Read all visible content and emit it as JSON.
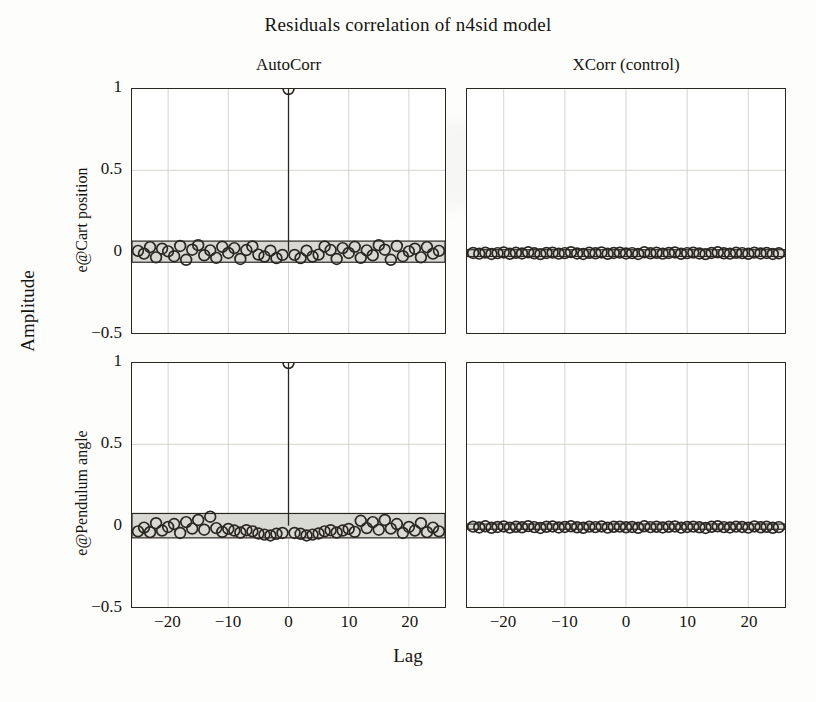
{
  "figure": {
    "title": "Residuals correlation of n4sid model",
    "xlabel": "Lag",
    "ylabel": "Amplitude"
  },
  "columns": [
    {
      "title": "AutoCorr"
    },
    {
      "title": "XCorr (control)"
    }
  ],
  "rows": [
    {
      "ylabel": "e@Cart position"
    },
    {
      "ylabel": "e@Pendulum angle"
    }
  ],
  "axes": {
    "ytick_labels": [
      "1",
      "0.5",
      "0",
      "−0.5"
    ],
    "ytick_values": [
      1,
      0.5,
      0,
      -0.5
    ],
    "xtick_labels": [
      "−20",
      "−10",
      "0",
      "10",
      "20"
    ],
    "xtick_values": [
      -20,
      -10,
      0,
      10,
      20
    ],
    "xlim": [
      -26,
      26
    ],
    "ylim": [
      -0.5,
      1.0
    ]
  },
  "style": {
    "line_color": "#2a2722",
    "band_fill": "#d9d9d4",
    "band_edge": "#2a2722",
    "grid_color": "#cfcfc9",
    "marker": "open-circle",
    "marker_radius_px": 5.4,
    "background": "#fdfdfc"
  },
  "chart_data": {
    "type": "line",
    "title": "Residuals correlation of n4sid model",
    "xlabel": "Lag",
    "ylabel": "Amplitude",
    "grid": true,
    "legend": "none",
    "xlim": [
      -26,
      26
    ],
    "ylim": [
      -0.5,
      1.0
    ],
    "panels": [
      {
        "id": "autocorr-cart-position",
        "row": 0,
        "col": 0,
        "col_title": "AutoCorr",
        "row_label": "e@Cart position",
        "confidence_band": [
          -0.065,
          0.065
        ],
        "lags": [
          -25,
          -24,
          -23,
          -22,
          -21,
          -20,
          -19,
          -18,
          -17,
          -16,
          -15,
          -14,
          -13,
          -12,
          -11,
          -10,
          -9,
          -8,
          -7,
          -6,
          -5,
          -4,
          -3,
          -2,
          -1,
          0,
          1,
          2,
          3,
          4,
          5,
          6,
          7,
          8,
          9,
          10,
          11,
          12,
          13,
          14,
          15,
          16,
          17,
          18,
          19,
          20,
          21,
          22,
          23,
          24,
          25
        ],
        "values": [
          0.005,
          -0.012,
          0.028,
          -0.035,
          0.018,
          0.002,
          -0.028,
          0.035,
          -0.05,
          0.012,
          0.04,
          -0.022,
          0.008,
          -0.038,
          0.03,
          -0.008,
          0.022,
          -0.045,
          0.01,
          0.032,
          -0.018,
          -0.03,
          0.006,
          -0.04,
          -0.02,
          1.0,
          -0.02,
          -0.04,
          0.006,
          -0.03,
          -0.018,
          0.032,
          0.01,
          -0.045,
          0.022,
          -0.008,
          0.03,
          -0.038,
          0.008,
          -0.022,
          0.04,
          0.012,
          -0.05,
          0.035,
          -0.028,
          0.002,
          0.018,
          -0.035,
          0.028,
          -0.012,
          0.005
        ]
      },
      {
        "id": "xcorr-control-cart-position",
        "row": 0,
        "col": 1,
        "col_title": "XCorr (control)",
        "row_label": "e@Cart position",
        "confidence_band": [
          -0.03,
          0.012
        ],
        "lags": [
          -25,
          -24,
          -23,
          -22,
          -21,
          -20,
          -19,
          -18,
          -17,
          -16,
          -15,
          -14,
          -13,
          -12,
          -11,
          -10,
          -9,
          -8,
          -7,
          -6,
          -5,
          -4,
          -3,
          -2,
          -1,
          0,
          1,
          2,
          3,
          4,
          5,
          6,
          7,
          8,
          9,
          10,
          11,
          12,
          13,
          14,
          15,
          16,
          17,
          18,
          19,
          20,
          21,
          22,
          23,
          24,
          25
        ],
        "values": [
          -0.008,
          -0.012,
          -0.006,
          -0.014,
          -0.009,
          -0.005,
          -0.013,
          -0.007,
          -0.011,
          -0.004,
          -0.01,
          -0.015,
          -0.008,
          -0.006,
          -0.012,
          -0.009,
          -0.003,
          -0.011,
          -0.014,
          -0.007,
          -0.01,
          -0.005,
          -0.013,
          -0.008,
          -0.006,
          -0.011,
          -0.009,
          -0.014,
          -0.004,
          -0.01,
          -0.007,
          -0.012,
          -0.008,
          -0.005,
          -0.013,
          -0.009,
          -0.006,
          -0.011,
          -0.015,
          -0.008,
          -0.004,
          -0.01,
          -0.012,
          -0.007,
          -0.009,
          -0.013,
          -0.006,
          -0.011,
          -0.008,
          -0.014,
          -0.01
        ]
      },
      {
        "id": "autocorr-pendulum-angle",
        "row": 1,
        "col": 0,
        "col_title": "AutoCorr",
        "row_label": "e@Pendulum angle",
        "confidence_band": [
          -0.075,
          0.075
        ],
        "lags": [
          -25,
          -24,
          -23,
          -22,
          -21,
          -20,
          -19,
          -18,
          -17,
          -16,
          -15,
          -14,
          -13,
          -12,
          -11,
          -10,
          -9,
          -8,
          -7,
          -6,
          -5,
          -4,
          -3,
          -2,
          -1,
          0,
          1,
          2,
          3,
          4,
          5,
          6,
          7,
          8,
          9,
          10,
          11,
          12,
          13,
          14,
          15,
          16,
          17,
          18,
          19,
          20,
          21,
          22,
          23,
          24,
          25
        ],
        "values": [
          -0.035,
          -0.012,
          -0.04,
          0.015,
          -0.03,
          -0.008,
          0.01,
          -0.045,
          0.022,
          -0.018,
          0.035,
          -0.025,
          0.055,
          -0.015,
          -0.038,
          -0.02,
          -0.03,
          -0.042,
          -0.028,
          -0.035,
          -0.048,
          -0.055,
          -0.06,
          -0.05,
          -0.045,
          1.0,
          -0.045,
          -0.05,
          -0.06,
          -0.055,
          -0.048,
          -0.035,
          -0.028,
          -0.042,
          -0.03,
          -0.02,
          -0.038,
          0.03,
          -0.015,
          0.022,
          -0.025,
          0.035,
          -0.018,
          0.01,
          -0.045,
          -0.008,
          -0.03,
          0.015,
          -0.04,
          -0.012,
          -0.035
        ]
      },
      {
        "id": "xcorr-control-pendulum-angle",
        "row": 1,
        "col": 1,
        "col_title": "XCorr (control)",
        "row_label": "e@Pendulum angle",
        "confidence_band": [
          -0.022,
          0.01
        ],
        "lags": [
          -25,
          -24,
          -23,
          -22,
          -21,
          -20,
          -19,
          -18,
          -17,
          -16,
          -15,
          -14,
          -13,
          -12,
          -11,
          -10,
          -9,
          -8,
          -7,
          -6,
          -5,
          -4,
          -3,
          -2,
          -1,
          0,
          1,
          2,
          3,
          4,
          5,
          6,
          7,
          8,
          9,
          10,
          11,
          12,
          13,
          14,
          15,
          16,
          17,
          18,
          19,
          20,
          21,
          22,
          23,
          24,
          25
        ],
        "values": [
          -0.006,
          -0.011,
          -0.004,
          -0.013,
          -0.008,
          -0.005,
          -0.012,
          -0.007,
          -0.01,
          -0.003,
          -0.009,
          -0.014,
          -0.007,
          -0.005,
          -0.011,
          -0.008,
          -0.004,
          -0.01,
          -0.013,
          -0.006,
          -0.009,
          -0.005,
          -0.012,
          -0.007,
          -0.006,
          -0.01,
          -0.008,
          -0.013,
          -0.004,
          -0.009,
          -0.007,
          -0.011,
          -0.007,
          -0.005,
          -0.012,
          -0.008,
          -0.006,
          -0.01,
          -0.014,
          -0.007,
          -0.004,
          -0.009,
          -0.011,
          -0.006,
          -0.008,
          -0.012,
          -0.005,
          -0.01,
          -0.007,
          -0.013,
          -0.009
        ]
      }
    ]
  }
}
